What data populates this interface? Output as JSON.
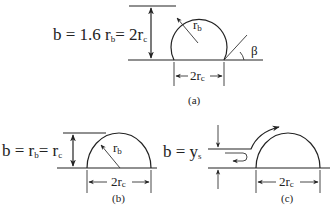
{
  "figure": {
    "panels": [
      {
        "id": "a",
        "caption": "(a)",
        "equation": {
          "b": "b = 1.6 r",
          "sub1": "b",
          "mid": "= 2r",
          "sub2": "c"
        },
        "radius_label": {
          "main": "r",
          "sub": "b"
        },
        "base_dim_label": {
          "main": "2r",
          "sub": "c"
        },
        "angle_label": "β",
        "shape": "truncated circle with contact angle"
      },
      {
        "id": "b",
        "caption": "(b)",
        "equation": {
          "b": "b = r",
          "sub1": "b",
          "mid": "= r",
          "sub2": "c"
        },
        "radius_label": {
          "main": "r",
          "sub": "b"
        },
        "base_dim_label": {
          "main": "2r",
          "sub": "c"
        },
        "shape": "semicircle"
      },
      {
        "id": "c",
        "caption": "(c)",
        "equation": {
          "b": "b = y",
          "sub1": "s"
        },
        "base_dim_label": {
          "main": "2r",
          "sub": "c"
        },
        "shape": "semicircle with separated flow and recirculation"
      }
    ],
    "colors": {
      "ink": "#222222",
      "background": "#ffffff"
    }
  }
}
